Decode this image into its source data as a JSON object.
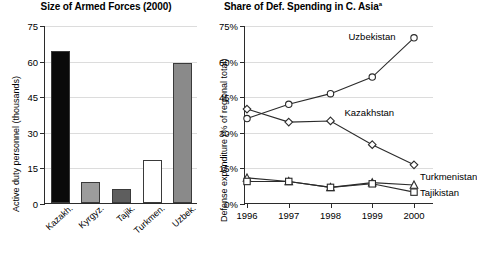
{
  "chart_data": [
    {
      "type": "bar",
      "title": "Size of Armed Forces (2000)",
      "xlabel": "",
      "ylabel": "Active duty personnel (thousands)",
      "ylim": [
        0,
        75
      ],
      "yticks": [
        "0",
        "15",
        "30",
        "45",
        "60",
        "75"
      ],
      "grid": true,
      "legend": "none",
      "categories": [
        "Kazakh.",
        "Kyrgyz.",
        "Tajik.",
        "Turkmen.",
        "Uzbek."
      ],
      "values": [
        64,
        9,
        6,
        18,
        59
      ],
      "bar_colors": [
        "#0a0a0a",
        "#9c9c9c",
        "#5e5e5e",
        "#ffffff",
        "#8a8a8a"
      ]
    },
    {
      "type": "line",
      "title": "Share of Def. Spending in C. Asia",
      "title_superscript": "a",
      "xlabel": "",
      "ylabel": "Defense expenditure (% of regional total)",
      "ylim": [
        0,
        75
      ],
      "yticks": [
        "0%",
        "15%",
        "30%",
        "45%",
        "60%",
        "75%"
      ],
      "x": [
        "1996",
        "1997",
        "1998",
        "1999",
        "2000"
      ],
      "grid": true,
      "legend": "inline-right",
      "series": [
        {
          "name": "Uzbekistan",
          "marker": "circle",
          "values": [
            36.0,
            42.0,
            46.5,
            53.5,
            70.0
          ]
        },
        {
          "name": "Kazakhstan",
          "marker": "diamond",
          "values": [
            40.0,
            34.5,
            35.0,
            25.0,
            16.5
          ]
        },
        {
          "name": "Turkmenistan",
          "marker": "triangle",
          "values": [
            11.0,
            9.5,
            7.0,
            9.0,
            8.0
          ]
        },
        {
          "name": "Tajikistan",
          "marker": "square",
          "values": [
            9.5,
            9.5,
            7.0,
            8.5,
            5.0
          ]
        }
      ]
    }
  ],
  "bar_chart": {
    "title": "Size of Armed Forces (2000)",
    "ylabel": "Active duty personnel (thousands)",
    "yticks": [
      "75",
      "60",
      "45",
      "30",
      "15",
      "0"
    ],
    "categories": [
      "Kazakh.",
      "Kyrgyz.",
      "Tajik.",
      "Turkmen.",
      "Uzbek."
    ]
  },
  "line_chart": {
    "title": "Share of Def. Spending in C. Asia",
    "title_superscript": "a",
    "ylabel": "Defense expenditure (% of regional total)",
    "yticks": [
      "75%",
      "60%",
      "45%",
      "30%",
      "15%",
      "0%"
    ],
    "xticks": [
      "1996",
      "1997",
      "1998",
      "1999",
      "2000"
    ],
    "series_labels": {
      "uzbekistan": "Uzbekistan",
      "kazakhstan": "Kazakhstan",
      "turkmenistan": "Turkmenistan",
      "tajikistan": "Tajikistan"
    }
  }
}
